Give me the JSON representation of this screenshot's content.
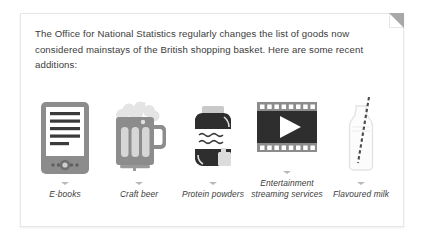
{
  "card": {
    "intro_text": "The Office for National Statistics regularly changes the list of goods now considered mainstays of the British shopping basket. Here are some recent additions:",
    "corner_fold": "folded-corner"
  },
  "items": [
    {
      "label": "E-books",
      "icon": "e-reader-icon"
    },
    {
      "label": "Craft beer",
      "icon": "beer-mug-icon"
    },
    {
      "label": "Protein powders",
      "icon": "protein-jar-icon"
    },
    {
      "label": "Entertainment streaming services",
      "icon": "film-strip-play-icon"
    },
    {
      "label": "Flavoured milk",
      "icon": "milk-bottle-straw-icon"
    }
  ],
  "colors": {
    "text": "#3b3b3b",
    "card_border": "#e6e6e6",
    "icon_dark": "#2e2e2e",
    "icon_mid": "#8c8c8c",
    "icon_light": "#d9d9d9",
    "caret": "#b9b9b9"
  }
}
